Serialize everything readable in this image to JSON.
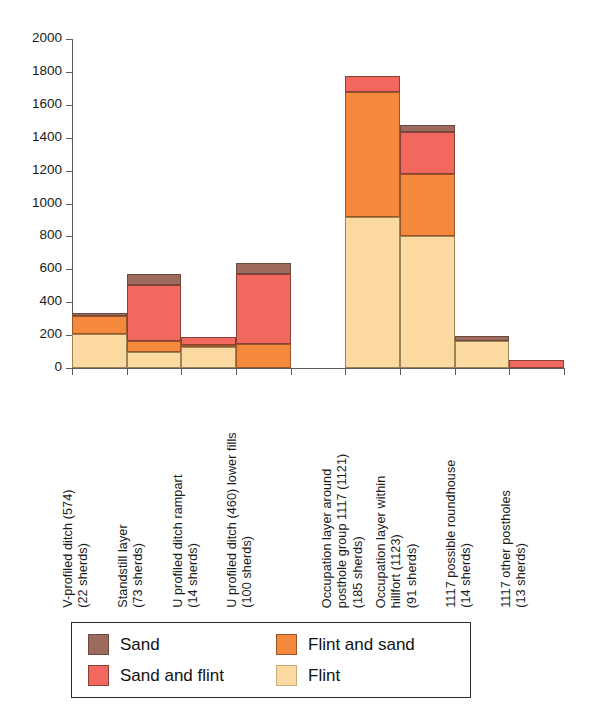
{
  "chart_data": {
    "type": "bar",
    "stacked": true,
    "title": "",
    "xlabel": "",
    "ylabel": "",
    "ylim": [
      0,
      2000
    ],
    "ytick_step": 200,
    "yticks": [
      0,
      200,
      400,
      600,
      800,
      1000,
      1200,
      1400,
      1600,
      1800,
      2000
    ],
    "grid": false,
    "legend_position": "bottom",
    "categories": [
      "V-profiled ditch (574)\n(22 sherds)",
      "Standstill layer\n(73 sherds)",
      "U profiled ditch rampart\n(14 sherds)",
      "U profiled ditch (460) lower fills\n(100 sherds)",
      "",
      "Occupation layer around posthole group 1117 (1121)\n(185 sherds)",
      "Occupation layer within hillfort (1123)\n(91 sherds)",
      "1117 possible roundhouse\n(14 sherds)",
      "1117 other postholes\n(13 sherds)"
    ],
    "category_lines": [
      [
        "V-profiled ditch (574)",
        "(22 sherds)"
      ],
      [
        "Standstill layer",
        "(73 sherds)"
      ],
      [
        "U profiled ditch rampart",
        "(14 sherds)"
      ],
      [
        "U profiled ditch (460) lower fills",
        ""
      ],
      [
        "",
        ""
      ],
      [
        "Occupation layer around",
        "posthole group 1117 (1121)",
        "(185 sherds)"
      ],
      [
        "Occupation layer within",
        "hillfort (1123)",
        "(91 sherds)"
      ],
      [
        "1117 possible roundhouse",
        "(14 sherds)"
      ],
      [
        "1117 other postholes",
        "(13 sherds)"
      ]
    ],
    "series": [
      {
        "name": "Flint",
        "color": "#fbd9a0",
        "values": [
          205,
          95,
          130,
          0,
          0,
          915,
          800,
          165,
          0
        ]
      },
      {
        "name": "Flint and sand",
        "color": "#f4883c",
        "values": [
          110,
          70,
          10,
          145,
          0,
          765,
          380,
          0,
          0
        ]
      },
      {
        "name": "Sand and flint",
        "color": "#f0685e",
        "values": [
          0,
          340,
          50,
          425,
          0,
          95,
          255,
          0,
          50
        ]
      },
      {
        "name": "Sand",
        "color": "#9c6b5e",
        "values": [
          20,
          65,
          0,
          70,
          0,
          0,
          45,
          30,
          0
        ]
      }
    ],
    "totals": [
      335,
      570,
      190,
      640,
      0,
      1775,
      1480,
      195,
      50
    ]
  },
  "legend": {
    "items": [
      {
        "label": "Sand",
        "swatch": "sw-sand"
      },
      {
        "label": "Flint and sand",
        "swatch": "sw-flintsand"
      },
      {
        "label": "Sand and flint",
        "swatch": "sw-sandflint"
      },
      {
        "label": "Flint",
        "swatch": "sw-flint"
      }
    ]
  }
}
